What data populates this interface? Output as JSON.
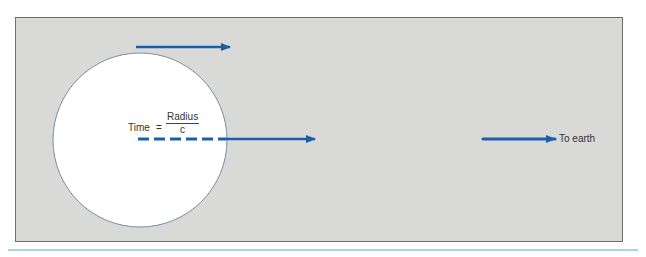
{
  "diagram": {
    "equation": {
      "lhs": "Time",
      "equals": "=",
      "numerator": "Radius",
      "denominator": "c"
    },
    "destination_label": "To earth",
    "colors": {
      "panel_bg": "#d9d9d7",
      "panel_border": "#6e6e6e",
      "circle_fill": "#ffffff",
      "circle_stroke": "#7a8fa3",
      "arrow": "#1b5fa8",
      "rule": "#a9d4ef"
    }
  }
}
